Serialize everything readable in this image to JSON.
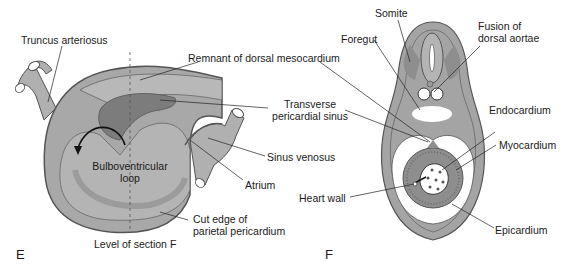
{
  "panels": {
    "E": {
      "letter": "E",
      "labels": {
        "truncus_arteriosus": "Truncus arteriosus",
        "remnant_dorsal_mesocardium": "Remnant of dorsal mesocardium",
        "transverse_pericardial_sinus_1": "Transverse",
        "transverse_pericardial_sinus_2": "pericardial sinus",
        "bulboventricular_loop_1": "Bulboventricular",
        "bulboventricular_loop_2": "loop",
        "sinus_venosus": "Sinus venosus",
        "atrium": "Atrium",
        "cut_edge_1": "Cut edge of",
        "cut_edge_2": "parietal pericardium",
        "level_of_section": "Level of section F"
      }
    },
    "F": {
      "letter": "F",
      "labels": {
        "somite": "Somite",
        "foregut": "Foregut",
        "fusion_1": "Fusion of",
        "fusion_2": "dorsal aortae",
        "endocardium": "Endocardium",
        "myocardium": "Myocardium",
        "heart_wall": "Heart wall",
        "epicardium": "Epicardium"
      }
    }
  },
  "colors": {
    "tissue_light": "#b4b4b4",
    "tissue_mid": "#9a9a9a",
    "tissue_dark": "#7a7a7a",
    "outline": "#555555",
    "cavity": "#ffffff"
  }
}
